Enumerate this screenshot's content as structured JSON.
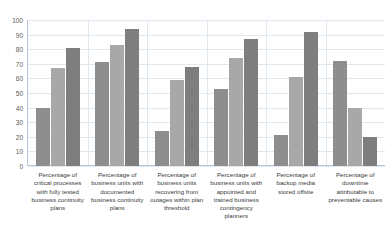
{
  "chart_data": {
    "type": "bar",
    "title": "",
    "subtitle": "",
    "xlabel": "",
    "ylabel": "",
    "ylim": [
      0,
      100
    ],
    "yticks": [
      0,
      10,
      20,
      30,
      40,
      50,
      60,
      70,
      80,
      90,
      100
    ],
    "grid": true,
    "legend": "none",
    "categories": [
      "Percentage of critical processes with fully tested business continuity plans",
      "Percentage of business units with documented business continuity plans",
      "Percentage of business units recovering from outages within plan threshold",
      "Percentage of business units with appointed and trained business contingency planners",
      "Percentage of backup media stored offsite",
      "Percentage of downtime attributable to preventable causes"
    ],
    "series": [
      {
        "name": "Series 1",
        "color": "#8e8e8e",
        "values": [
          40,
          71,
          24,
          53,
          21,
          72
        ]
      },
      {
        "name": "Series 2",
        "color": "#a8a8a8",
        "values": [
          67,
          83,
          59,
          74,
          61,
          40
        ]
      },
      {
        "name": "Series 3",
        "color": "#7e7e7e",
        "values": [
          81,
          94,
          68,
          87,
          92,
          20
        ]
      }
    ]
  },
  "colors": {
    "background": "#ffffff",
    "gridline": "#dfe7f0",
    "axis": "#b9c6d6",
    "tick_text": "#5b5b5b",
    "label_text": "#3a3a3a"
  }
}
